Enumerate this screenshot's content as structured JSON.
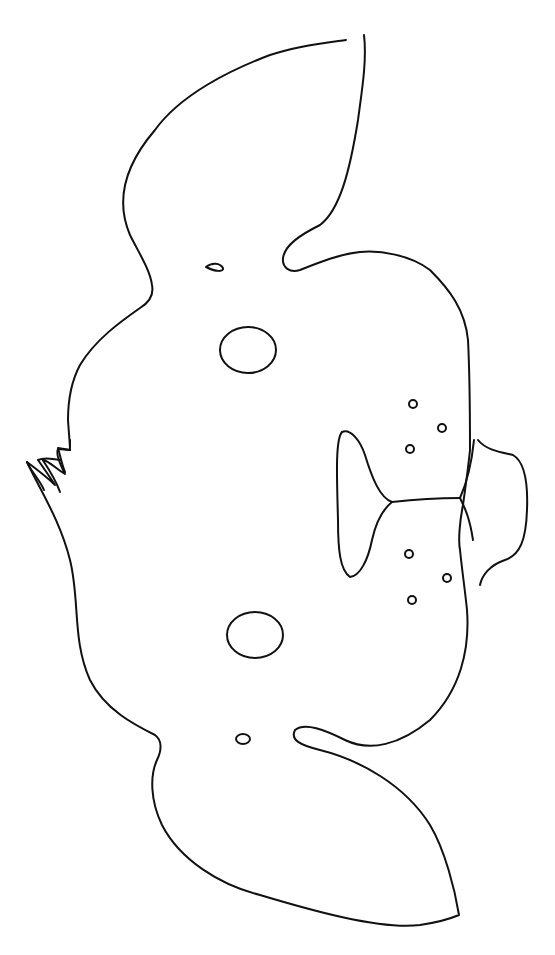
{
  "image": {
    "subject": "dog mask coloring page outline (rotated)",
    "background_color": "#ffffff",
    "line_color": "#111111",
    "parts": [
      {
        "name": "upper-ear"
      },
      {
        "name": "lower-ear"
      },
      {
        "name": "head-outline"
      },
      {
        "name": "hair-tuft"
      },
      {
        "name": "upper-eye-hole"
      },
      {
        "name": "lower-eye-hole"
      },
      {
        "name": "upper-nostril-hole"
      },
      {
        "name": "lower-nostril-hole"
      },
      {
        "name": "nose"
      },
      {
        "name": "muzzle"
      },
      {
        "name": "tongue"
      },
      {
        "name": "whisker-dots",
        "count": 6
      }
    ]
  }
}
